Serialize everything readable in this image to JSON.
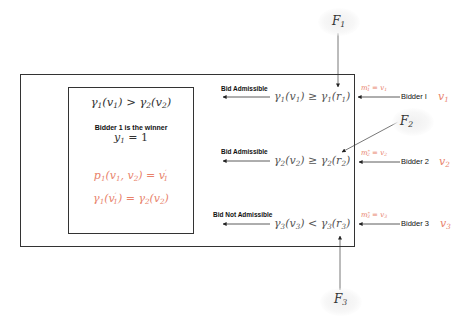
{
  "colors": {
    "accent": "#e8826b",
    "math_gray": "#555555",
    "text_dark": "#111111",
    "border": "#333333"
  },
  "winner_box": {
    "comparison": "γ1(v1) > γ2(v2)",
    "winner_label": "Bidder 1 is the winner",
    "winner_eq": "y1 = 1",
    "price_eq": "p1(v1, v2) = v'1",
    "equality_eq": "γ1(v'1) = γ2(v2)"
  },
  "rows": [
    {
      "status": "Bid Admissible",
      "condition": "γ1(v1) ≥ γ1(r1)",
      "message": "m*1 = v1",
      "bidder": "Bidder I",
      "value": "v1",
      "fn": "F1"
    },
    {
      "status": "Bid Admissible",
      "condition": "γ2(v2) ≥ γ2(r2)",
      "message": "m*2 = v2",
      "bidder": "Bidder 2",
      "value": "v2",
      "fn": "F2"
    },
    {
      "status": "Bid Not Admissible",
      "condition": "γ3(v3) < γ3(r3)",
      "message": "m*3 = v3",
      "bidder": "Bidder 3",
      "value": "v3",
      "fn": "F3"
    }
  ]
}
